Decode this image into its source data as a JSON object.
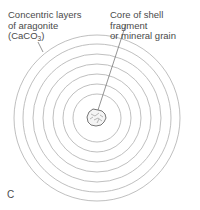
{
  "diagram": {
    "panel_label": "C",
    "labels": {
      "layers_line1": "Concentric layers",
      "layers_line2": "of aragonite",
      "layers_formula_prefix": "(CaCO",
      "layers_formula_sub": "3",
      "layers_formula_suffix": ")",
      "core_line1": "Core of shell fragment",
      "core_line2": "or mineral grain"
    },
    "rings": {
      "center_x": 97,
      "center_y": 118,
      "radii": [
        24,
        34,
        44,
        54,
        64,
        74,
        83
      ],
      "stroke_color": "#b5b5b5"
    },
    "core": {
      "stroke_color": "#555555"
    },
    "leader_color": "#666666"
  }
}
